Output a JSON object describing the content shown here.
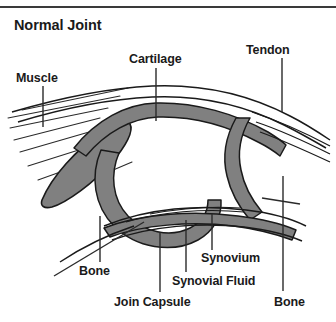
{
  "figure": {
    "title": "Normal Joint",
    "type": "anatomical-cross-section",
    "colors": {
      "cartilage_fill": "#808080",
      "muscle_fill": "#808080",
      "outline": "#1a1a1a",
      "text": "#1a1a1a",
      "background": "#ffffff",
      "top_rule": "#3a3a3a"
    },
    "labels": {
      "muscle": "Muscle",
      "cartilage": "Cartilage",
      "tendon": "Tendon",
      "bone_left": "Bone",
      "join_capsule": "Join Capsule",
      "synovium": "Synovium",
      "synovial_fluid": "Synovial Fluid",
      "bone_right": "Bone"
    },
    "structures": [
      "muscle-belly",
      "tendon-fibers",
      "upper-bone",
      "lower-bone",
      "articular-cartilage",
      "joint-capsule",
      "synovial-membrane",
      "synovial-cavity"
    ]
  }
}
